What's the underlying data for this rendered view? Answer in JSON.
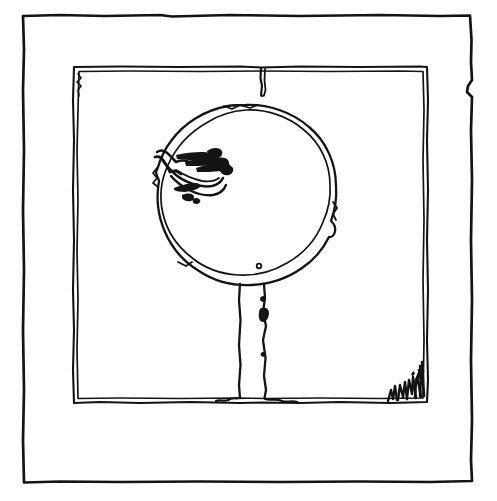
{
  "artwork": {
    "title": "Lollipop tree line drawing",
    "medium": "black ink line drawing on white paper",
    "style": "hand-drawn traced contour",
    "background_color": "#ffffff",
    "ink_color": "#141414",
    "canvas": {
      "width": 497,
      "height": 501
    }
  },
  "elements": {
    "outer_border": {
      "name": "outer border rectangle",
      "stroke_width": 2.6,
      "bounds": {
        "x": 22,
        "y": 14,
        "width": 452,
        "height": 469
      },
      "notes": "slightly wavy hand-ruled rectangle with a small notch on the right edge"
    },
    "inner_frame": {
      "name": "inner frame rectangle",
      "stroke_width": 2.2,
      "double_line": true,
      "bounds": {
        "x": 73,
        "y": 66,
        "width": 354,
        "height": 337
      },
      "notes": "drawn with two closely spaced parallel strokes"
    },
    "frame_tick": {
      "name": "short vertical tick hanging from inner frame top edge",
      "x": 262,
      "y_start": 68,
      "y_end": 96
    },
    "circle": {
      "name": "large circle (lollipop head / tree crown)",
      "center_x": 246,
      "center_y": 195,
      "radius_x": 89,
      "radius_y": 90,
      "double_line": true,
      "stroke_width": 2.2
    },
    "stem": {
      "name": "vertical stem / post",
      "left_x": 238,
      "right_x": 265,
      "y_top": 283,
      "y_bottom": 402
    },
    "hand_scribble": {
      "name": "hand-shaped scribble inside circle upper-left",
      "bounds": {
        "x": 155,
        "y": 143,
        "width": 80,
        "height": 62
      }
    },
    "circle_dot": {
      "name": "small dot near bottom of circle",
      "cx": 259,
      "cy": 266,
      "r": 2.4
    },
    "grass_scribbles": {
      "name": "small grass tufts at bottom-right inside corner",
      "bounds": {
        "x": 385,
        "y": 368,
        "width": 42,
        "height": 34
      },
      "count": 5
    }
  }
}
